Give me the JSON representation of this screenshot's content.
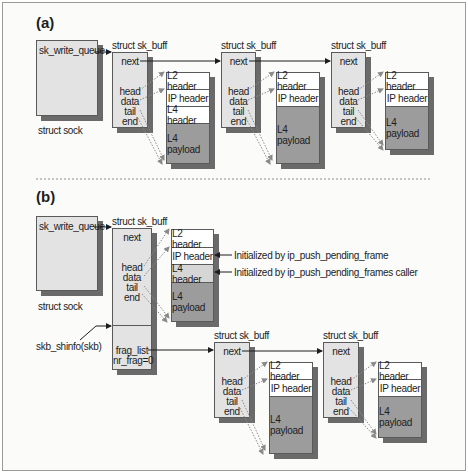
{
  "sections": {
    "a": {
      "label": "(a)",
      "sock": {
        "field": "sk_write_queue",
        "caption": "struct sock"
      },
      "skbs": [
        {
          "title": "struct sk_buff",
          "next": "next",
          "ptrs": [
            "head",
            "data",
            "tail",
            "end"
          ]
        },
        {
          "title": "struct sk_buff",
          "next": "next",
          "ptrs": [
            "head",
            "data",
            "tail",
            "end"
          ]
        },
        {
          "title": "struct sk_buff",
          "next": "next",
          "ptrs": [
            "head",
            "data",
            "tail",
            "end"
          ]
        }
      ],
      "packets": [
        {
          "l2": "L2 header",
          "ip": "IP header",
          "l4": "L4 header",
          "payload": "L4 payload"
        },
        {
          "l2": "L2 header",
          "ip": "IP header",
          "payload": "L4 payload"
        },
        {
          "l2": "L2 header",
          "ip": "IP header",
          "payload": "L4 payload"
        }
      ]
    },
    "b": {
      "label": "(b)",
      "sock": {
        "field": "sk_write_queue",
        "caption": "struct sock"
      },
      "shinfo_label": "skb_shinfo(skb)",
      "head_skb": {
        "title": "struct sk_buff",
        "next": "next",
        "ptrs": [
          "head",
          "data",
          "tail",
          "end"
        ],
        "frag_list": "frag_list",
        "nr_frag": "nr_frag=0"
      },
      "head_packet": {
        "l2": "L2 header",
        "ip": "IP header",
        "l4": "L4 header",
        "payload": "L4 payload"
      },
      "annotations": {
        "ip": "Initialized by ip_push_pending_frame",
        "l4": "Initialized by ip_push_pending_frames caller"
      },
      "frag_skbs": [
        {
          "title": "struct sk_buff",
          "next": "next",
          "ptrs": [
            "head",
            "data",
            "tail",
            "end"
          ]
        },
        {
          "title": "struct sk_buff",
          "next": "next",
          "ptrs": [
            "head",
            "data",
            "tail",
            "end"
          ]
        }
      ],
      "frag_packets": [
        {
          "l2": "L2 header",
          "ip": "IP header",
          "payload": "L4 payload"
        },
        {
          "l2": "L2 header",
          "ip": "IP header",
          "payload": "L4 payload"
        }
      ]
    }
  },
  "colors": {
    "box_fill": "#e3e3e3",
    "payload_fill": "#9c9c9c",
    "header_fill": "#ffffff",
    "l4_header_b_fill": "#d6d6d6",
    "shadow": "#6a6a6a",
    "stroke": "#5a5a5a"
  }
}
